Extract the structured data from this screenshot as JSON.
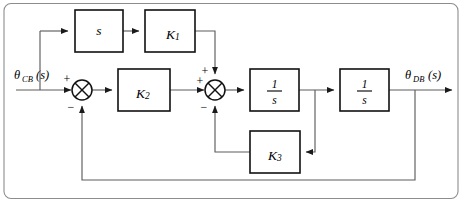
{
  "diagram": {
    "type": "block-diagram",
    "background_color": "#ffffff",
    "line_color": "#5d5d5d",
    "block_stroke_color": "#111111",
    "text_color": "#000000",
    "frame_color": "#8d8d8d"
  },
  "io": {
    "input": {
      "symbol": "θ",
      "subscript": "CB",
      "argument": "(s)",
      "full": "θCB(s)"
    },
    "output": {
      "symbol": "θ",
      "subscript": "DB",
      "argument": "(s)",
      "full": "θDB(s)"
    }
  },
  "blocks": [
    {
      "id": "derivative",
      "label": "s",
      "kind": "transfer-function",
      "numerator": "",
      "denominator": "",
      "x": 75,
      "y": 10,
      "width": 48,
      "height": 42
    },
    {
      "id": "gain-k1",
      "label": "K",
      "subscript": "1",
      "kind": "gain",
      "x": 145,
      "y": 10,
      "width": 50,
      "height": 42
    },
    {
      "id": "gain-k2",
      "label": "K",
      "subscript": "2",
      "kind": "gain",
      "x": 118,
      "y": 69,
      "width": 52,
      "height": 42
    },
    {
      "id": "integrator-1",
      "label": "1/s",
      "kind": "integrator",
      "numerator": "1",
      "denominator": "s",
      "x": 250,
      "y": 69,
      "width": 49,
      "height": 42
    },
    {
      "id": "integrator-2",
      "label": "1/s",
      "kind": "integrator",
      "numerator": "1",
      "denominator": "s",
      "x": 340,
      "y": 69,
      "width": 49,
      "height": 42
    },
    {
      "id": "gain-k3",
      "label": "K",
      "subscript": "3",
      "kind": "gain",
      "x": 250,
      "y": 131,
      "width": 50,
      "height": 42
    }
  ],
  "summing_junctions": [
    {
      "id": "sum-1",
      "cx": 82,
      "cy": 90,
      "r": 10,
      "signs": [
        {
          "port": "left",
          "sign": "+"
        },
        {
          "port": "bottom",
          "sign": "−"
        }
      ]
    },
    {
      "id": "sum-2",
      "cx": 215,
      "cy": 90,
      "r": 10,
      "signs": [
        {
          "port": "top",
          "sign": "+"
        },
        {
          "port": "left",
          "sign": "+"
        },
        {
          "port": "bottom",
          "sign": "−"
        }
      ]
    }
  ],
  "signal_paths": [
    {
      "id": "input-to-sum1",
      "from": "input",
      "to": "sum-1"
    },
    {
      "id": "input-branch-to-derivative",
      "from": "input-node",
      "to": "derivative"
    },
    {
      "id": "derivative-to-k1",
      "from": "derivative",
      "to": "gain-k1"
    },
    {
      "id": "k1-to-sum2-top",
      "from": "gain-k1",
      "to": "sum-2"
    },
    {
      "id": "sum1-to-k2",
      "from": "sum-1",
      "to": "gain-k2"
    },
    {
      "id": "k2-to-sum2-left",
      "from": "gain-k2",
      "to": "sum-2"
    },
    {
      "id": "sum2-to-integrator1",
      "from": "sum-2",
      "to": "integrator-1"
    },
    {
      "id": "integrator1-to-integrator2",
      "from": "integrator-1",
      "to": "integrator-2"
    },
    {
      "id": "integrator1-tap-to-k3",
      "from": "integrator-1",
      "to": "gain-k3"
    },
    {
      "id": "k3-to-sum2-bottom",
      "from": "gain-k3",
      "to": "sum-2"
    },
    {
      "id": "integrator2-to-output",
      "from": "integrator-2",
      "to": "output"
    },
    {
      "id": "output-feedback-to-sum1",
      "from": "output-node",
      "to": "sum-1"
    }
  ]
}
